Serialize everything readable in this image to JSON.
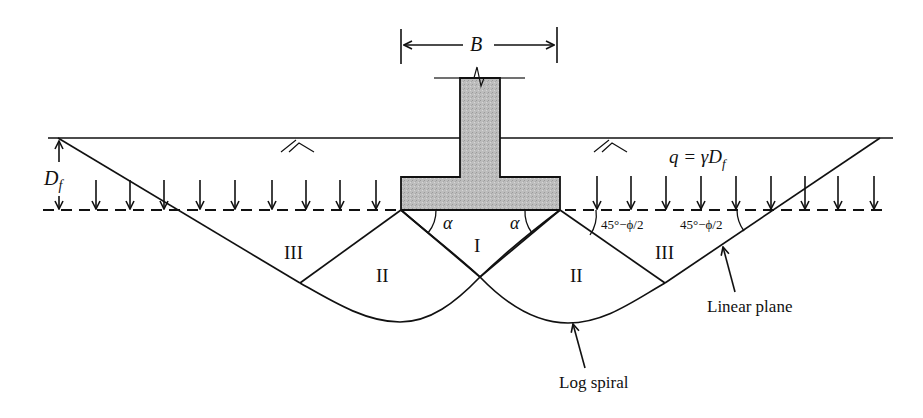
{
  "diagram": {
    "labels": {
      "width": "B",
      "depth": "D",
      "depth_sub": "f",
      "surcharge": "q = γD",
      "surcharge_sub": "f",
      "zone_1": "I",
      "zone_2_left": "II",
      "zone_2_right": "II",
      "zone_3_left": "III",
      "zone_3_right": "III",
      "alpha_left": "α",
      "alpha_right": "α",
      "angle_passive_1": "45°−ϕ/2",
      "angle_passive_2": "45°−ϕ/2",
      "linear_plane": "Linear plane",
      "log_spiral": "Log spiral"
    },
    "colors": {
      "line": "#111111",
      "footing_fill": "#b9b9b9",
      "background": "#ffffff"
    },
    "surcharge_arrow_count_left": 10,
    "surcharge_arrow_count_right": 9
  }
}
